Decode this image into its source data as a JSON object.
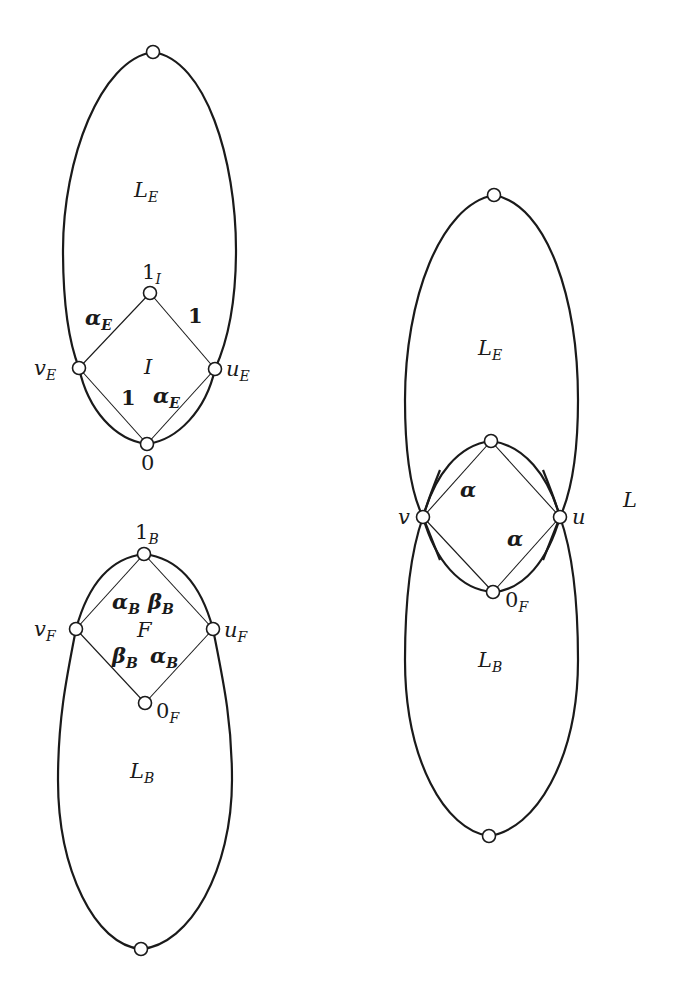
{
  "diagram": {
    "type": "lattice-gluing-figure",
    "figures": [
      {
        "id": "top-left",
        "region_labels": {
          "outer": {
            "main": "L",
            "sub": "E"
          },
          "inner": {
            "main": "I",
            "sub": ""
          }
        },
        "nodes": {
          "top": {
            "label": "",
            "x": 153,
            "y": 52
          },
          "one_I": {
            "main": "1",
            "sub": "I",
            "x": 150,
            "y": 293
          },
          "v_E": {
            "main": "v",
            "sub": "E",
            "x": 79,
            "y": 368
          },
          "u_E": {
            "main": "u",
            "sub": "E",
            "x": 215,
            "y": 369
          },
          "zero": {
            "main": "0",
            "sub": "",
            "x": 147,
            "y": 444
          }
        },
        "edge_labels": {
          "upper_left": {
            "main": "α",
            "sub": "E"
          },
          "upper_right": {
            "main": "1",
            "sub": ""
          },
          "lower_left": {
            "main": "1",
            "sub": ""
          },
          "lower_right": {
            "main": "α",
            "sub": "E"
          }
        }
      },
      {
        "id": "bottom-left",
        "region_labels": {
          "inner": {
            "main": "F",
            "sub": ""
          },
          "outer": {
            "main": "L",
            "sub": "B"
          }
        },
        "nodes": {
          "one_B": {
            "main": "1",
            "sub": "B",
            "x": 144,
            "y": 554
          },
          "v_F": {
            "main": "v",
            "sub": "F",
            "x": 76,
            "y": 629
          },
          "u_F": {
            "main": "u",
            "sub": "F",
            "x": 213,
            "y": 629
          },
          "zero_F": {
            "main": "0",
            "sub": "F",
            "x": 145,
            "y": 703
          },
          "bottom": {
            "label": "",
            "x": 141,
            "y": 949
          }
        },
        "edge_labels": {
          "upper_left": {
            "main": "α",
            "sub": "B"
          },
          "upper_right": {
            "main": "β",
            "sub": "B"
          },
          "lower_left": {
            "main": "β",
            "sub": "B"
          },
          "lower_right": {
            "main": "α",
            "sub": "B"
          }
        }
      },
      {
        "id": "right",
        "figure_label": {
          "main": "L",
          "sub": ""
        },
        "region_labels": {
          "upper": {
            "main": "L",
            "sub": "E"
          },
          "lower": {
            "main": "L",
            "sub": "B"
          }
        },
        "nodes": {
          "top": {
            "label": "",
            "x": 494,
            "y": 195
          },
          "mid_top": {
            "label": "",
            "x": 491,
            "y": 441
          },
          "v": {
            "main": "v",
            "sub": "",
            "x": 423,
            "y": 517
          },
          "u": {
            "main": "u",
            "sub": "",
            "x": 560,
            "y": 517
          },
          "zero_F": {
            "main": "0",
            "sub": "F",
            "x": 493,
            "y": 592
          },
          "bottom": {
            "label": "",
            "x": 489,
            "y": 836
          }
        },
        "edge_labels": {
          "upper_left": {
            "main": "α",
            "sub": ""
          },
          "lower_right": {
            "main": "α",
            "sub": ""
          }
        }
      }
    ]
  }
}
